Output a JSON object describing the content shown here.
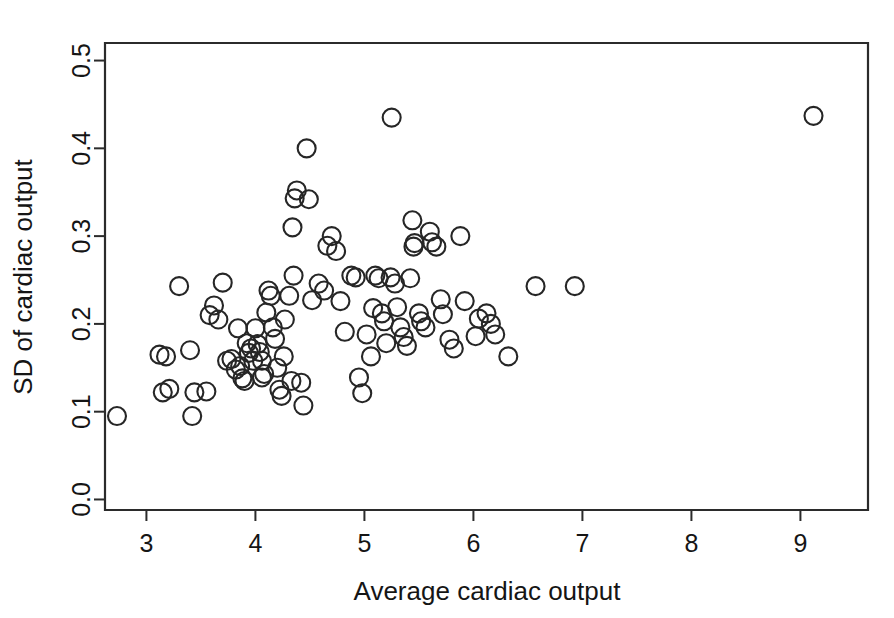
{
  "figure": {
    "background_color": "#ffffff",
    "marker_color": "#262626",
    "axis_color": "#2b2b2b",
    "width": 894,
    "height": 618
  },
  "chart_data": {
    "type": "scatter",
    "title": "",
    "xlabel": "Average cardiac output",
    "ylabel": "SD of cardiac output",
    "xlim": [
      2.62,
      9.62
    ],
    "ylim": [
      -0.012,
      0.52
    ],
    "xticks": [
      3,
      4,
      5,
      6,
      7,
      8,
      9
    ],
    "xtick_labels": [
      "3",
      "4",
      "5",
      "6",
      "7",
      "8",
      "9"
    ],
    "yticks": [
      0.0,
      0.1,
      0.2,
      0.3,
      0.4,
      0.5
    ],
    "ytick_labels": [
      "0.0",
      "0.1",
      "0.2",
      "0.3",
      "0.4",
      "0.5"
    ],
    "grid": false,
    "legend": null,
    "marker": "open-circle",
    "marker_size": 9,
    "n_points": 103,
    "points": [
      {
        "x": 2.73,
        "y": 0.095
      },
      {
        "x": 3.12,
        "y": 0.165
      },
      {
        "x": 3.18,
        "y": 0.163
      },
      {
        "x": 3.15,
        "y": 0.122
      },
      {
        "x": 3.21,
        "y": 0.126
      },
      {
        "x": 3.3,
        "y": 0.243
      },
      {
        "x": 3.4,
        "y": 0.17
      },
      {
        "x": 3.44,
        "y": 0.122
      },
      {
        "x": 3.42,
        "y": 0.095
      },
      {
        "x": 3.55,
        "y": 0.123
      },
      {
        "x": 3.58,
        "y": 0.21
      },
      {
        "x": 3.62,
        "y": 0.221
      },
      {
        "x": 3.66,
        "y": 0.205
      },
      {
        "x": 3.7,
        "y": 0.247
      },
      {
        "x": 3.74,
        "y": 0.158
      },
      {
        "x": 3.78,
        "y": 0.16
      },
      {
        "x": 3.82,
        "y": 0.148
      },
      {
        "x": 3.86,
        "y": 0.152
      },
      {
        "x": 3.88,
        "y": 0.138
      },
      {
        "x": 3.9,
        "y": 0.135
      },
      {
        "x": 3.92,
        "y": 0.178
      },
      {
        "x": 3.94,
        "y": 0.167
      },
      {
        "x": 3.96,
        "y": 0.172
      },
      {
        "x": 3.98,
        "y": 0.158
      },
      {
        "x": 4.0,
        "y": 0.195
      },
      {
        "x": 4.02,
        "y": 0.177
      },
      {
        "x": 4.04,
        "y": 0.168
      },
      {
        "x": 4.06,
        "y": 0.158
      },
      {
        "x": 4.08,
        "y": 0.143
      },
      {
        "x": 4.06,
        "y": 0.139
      },
      {
        "x": 4.1,
        "y": 0.213
      },
      {
        "x": 4.12,
        "y": 0.238
      },
      {
        "x": 4.14,
        "y": 0.232
      },
      {
        "x": 4.16,
        "y": 0.196
      },
      {
        "x": 4.18,
        "y": 0.183
      },
      {
        "x": 4.2,
        "y": 0.15
      },
      {
        "x": 4.22,
        "y": 0.125
      },
      {
        "x": 4.24,
        "y": 0.118
      },
      {
        "x": 4.27,
        "y": 0.205
      },
      {
        "x": 4.31,
        "y": 0.232
      },
      {
        "x": 4.35,
        "y": 0.255
      },
      {
        "x": 4.34,
        "y": 0.31
      },
      {
        "x": 4.36,
        "y": 0.343
      },
      {
        "x": 4.38,
        "y": 0.352
      },
      {
        "x": 4.47,
        "y": 0.4
      },
      {
        "x": 4.33,
        "y": 0.135
      },
      {
        "x": 4.42,
        "y": 0.133
      },
      {
        "x": 4.44,
        "y": 0.107
      },
      {
        "x": 4.52,
        "y": 0.227
      },
      {
        "x": 4.58,
        "y": 0.246
      },
      {
        "x": 4.63,
        "y": 0.238
      },
      {
        "x": 4.66,
        "y": 0.289
      },
      {
        "x": 4.7,
        "y": 0.3
      },
      {
        "x": 4.74,
        "y": 0.283
      },
      {
        "x": 4.78,
        "y": 0.226
      },
      {
        "x": 4.82,
        "y": 0.191
      },
      {
        "x": 4.88,
        "y": 0.255
      },
      {
        "x": 4.92,
        "y": 0.253
      },
      {
        "x": 4.95,
        "y": 0.139
      },
      {
        "x": 4.98,
        "y": 0.121
      },
      {
        "x": 5.02,
        "y": 0.188
      },
      {
        "x": 5.06,
        "y": 0.163
      },
      {
        "x": 5.1,
        "y": 0.255
      },
      {
        "x": 5.13,
        "y": 0.252
      },
      {
        "x": 5.16,
        "y": 0.212
      },
      {
        "x": 5.18,
        "y": 0.203
      },
      {
        "x": 5.2,
        "y": 0.178
      },
      {
        "x": 5.25,
        "y": 0.435
      },
      {
        "x": 5.24,
        "y": 0.253
      },
      {
        "x": 5.28,
        "y": 0.246
      },
      {
        "x": 5.3,
        "y": 0.219
      },
      {
        "x": 5.33,
        "y": 0.196
      },
      {
        "x": 5.36,
        "y": 0.185
      },
      {
        "x": 5.39,
        "y": 0.175
      },
      {
        "x": 5.42,
        "y": 0.252
      },
      {
        "x": 5.45,
        "y": 0.288
      },
      {
        "x": 5.46,
        "y": 0.292
      },
      {
        "x": 5.44,
        "y": 0.318
      },
      {
        "x": 5.5,
        "y": 0.212
      },
      {
        "x": 5.52,
        "y": 0.203
      },
      {
        "x": 5.56,
        "y": 0.196
      },
      {
        "x": 5.6,
        "y": 0.305
      },
      {
        "x": 5.62,
        "y": 0.293
      },
      {
        "x": 5.66,
        "y": 0.288
      },
      {
        "x": 5.7,
        "y": 0.228
      },
      {
        "x": 5.72,
        "y": 0.211
      },
      {
        "x": 5.78,
        "y": 0.182
      },
      {
        "x": 5.82,
        "y": 0.172
      },
      {
        "x": 5.88,
        "y": 0.3
      },
      {
        "x": 5.92,
        "y": 0.226
      },
      {
        "x": 6.02,
        "y": 0.186
      },
      {
        "x": 6.05,
        "y": 0.206
      },
      {
        "x": 6.12,
        "y": 0.212
      },
      {
        "x": 6.16,
        "y": 0.2
      },
      {
        "x": 6.2,
        "y": 0.188
      },
      {
        "x": 6.32,
        "y": 0.163
      },
      {
        "x": 6.57,
        "y": 0.243
      },
      {
        "x": 6.93,
        "y": 0.243
      },
      {
        "x": 9.12,
        "y": 0.437
      },
      {
        "x": 4.26,
        "y": 0.163
      },
      {
        "x": 3.84,
        "y": 0.195
      },
      {
        "x": 4.49,
        "y": 0.342
      },
      {
        "x": 5.08,
        "y": 0.218
      }
    ]
  },
  "axes_geometry": {
    "plot_left_px": 105,
    "plot_right_px": 868,
    "plot_top_px": 43,
    "plot_bottom_px": 510
  }
}
